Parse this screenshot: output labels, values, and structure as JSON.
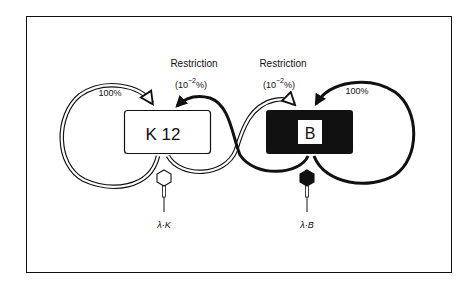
{
  "diagram": {
    "left_host": {
      "label": "K 12",
      "style": "outline"
    },
    "right_host": {
      "label": "B",
      "style": "filled"
    },
    "left_self_rate": "100%",
    "right_self_rate": "100%",
    "restriction_left": {
      "title": "Restriction",
      "rate_prefix": "(10",
      "rate_exp": "−2",
      "rate_suffix": "%)"
    },
    "restriction_right": {
      "title": "Restriction",
      "rate_prefix": "(10",
      "rate_exp": "−2",
      "rate_suffix": "%)"
    },
    "phage_left": {
      "label": "λ·K",
      "style": "outline"
    },
    "phage_right": {
      "label": "λ·B",
      "style": "filled"
    }
  },
  "colors": {
    "ink": "#111111",
    "paper": "#ffffff"
  }
}
